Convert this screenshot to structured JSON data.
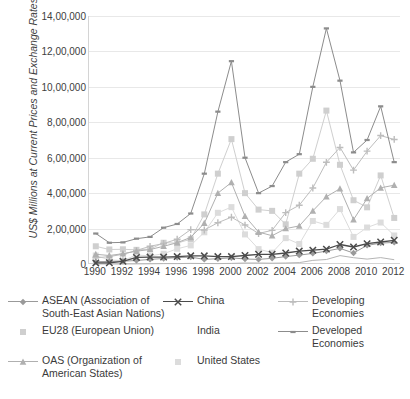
{
  "chart_data": {
    "type": "line",
    "title": "",
    "xlabel": "",
    "ylabel": "US$ Millions at Current Prices and Exchange Rates",
    "x": [
      1990,
      1991,
      1992,
      1993,
      1994,
      1995,
      1996,
      1997,
      1998,
      1999,
      2000,
      2001,
      2002,
      2003,
      2004,
      2005,
      2006,
      2007,
      2008,
      2009,
      2010,
      2011,
      2012
    ],
    "xlim": [
      1989.5,
      2012.5
    ],
    "ylim": [
      0,
      1400000
    ],
    "yticks": [
      0,
      200000,
      400000,
      600000,
      800000,
      1000000,
      1200000,
      1400000
    ],
    "ytick_labels": [
      "0",
      "2,00,000",
      "4,00,000",
      "6,00,000",
      "8,00,000",
      "10,00,000",
      "12,00,000",
      "14,00,000"
    ],
    "xticks": [
      1990,
      1992,
      1994,
      1996,
      1998,
      2000,
      2002,
      2004,
      2006,
      2008,
      2010,
      2012
    ],
    "xtick_labels": [
      "1990",
      "1992",
      "1994",
      "1996",
      "1998",
      "2000",
      "2002",
      "2004",
      "2006",
      "2008",
      "2010",
      "2012"
    ],
    "grid": "horizontal",
    "legend_position": "bottom",
    "series": [
      {
        "name": "ASEAN (Association of\nSouth-East Asian Nations)",
        "short": "ASEAN",
        "color": "#9a9a9a",
        "marker": "diamond",
        "values": [
          13000,
          14000,
          16000,
          20000,
          26000,
          31000,
          36000,
          39000,
          26000,
          30000,
          35000,
          28000,
          26000,
          32000,
          42000,
          50000,
          60000,
          73000,
          88000,
          62000,
          105000,
          118000,
          122000
        ]
      },
      {
        "name": "China",
        "short": "China",
        "color": "#4b4b4b",
        "marker": "x",
        "values": [
          6000,
          7000,
          15000,
          37000,
          39000,
          39000,
          42000,
          46000,
          46000,
          42000,
          42000,
          48000,
          55000,
          55000,
          62000,
          73000,
          78000,
          84000,
          110000,
          96000,
          115000,
          124000,
          134000
        ]
      },
      {
        "name": "Developing Economies",
        "short": "Developing Economies",
        "color": "#bdbdbd",
        "marker": "plus",
        "values": [
          35000,
          42000,
          55000,
          77000,
          100000,
          116000,
          140000,
          194000,
          192000,
          233000,
          264000,
          220000,
          172000,
          190000,
          290000,
          332000,
          429000,
          574000,
          658000,
          530000,
          637000,
          725000,
          703000
        ]
      },
      {
        "name": "EU28 (European Union)",
        "short": "EU28",
        "color": "#cfcfcf",
        "marker": "square",
        "values": [
          100000,
          82000,
          83000,
          80000,
          84000,
          120000,
          118000,
          140000,
          280000,
          510000,
          705000,
          400000,
          307000,
          300000,
          224000,
          510000,
          594000,
          866000,
          560000,
          360000,
          320000,
          500000,
          260000
        ]
      },
      {
        "name": "India",
        "short": "India",
        "color": "#b5b5b5",
        "marker": "none",
        "values": [
          237,
          75,
          252,
          532,
          974,
          2151,
          2525,
          3619,
          2633,
          2168,
          3585,
          5478,
          5630,
          4321,
          5778,
          7622,
          20328,
          25350,
          47139,
          35657,
          27431,
          36190,
          24196
        ]
      },
      {
        "name": "Developed Economies",
        "short": "Developed Economies",
        "color": "#8c8c8c",
        "marker": "dash",
        "values": [
          172000,
          120000,
          122000,
          143000,
          153000,
          205000,
          226000,
          285000,
          510000,
          860000,
          1145000,
          600000,
          400000,
          440000,
          575000,
          620000,
          1000000,
          1330000,
          1035000,
          630000,
          700000,
          890000,
          575000
        ]
      },
      {
        "name": "OAS (Organization of\nAmerican States)",
        "short": "OAS",
        "color": "#b0b0b0",
        "marker": "triangle",
        "values": [
          55000,
          48000,
          58000,
          72000,
          82000,
          100000,
          120000,
          150000,
          230000,
          400000,
          460000,
          270000,
          180000,
          160000,
          200000,
          215000,
          300000,
          380000,
          425000,
          250000,
          370000,
          430000,
          445000
        ]
      },
      {
        "name": "United States",
        "short": "United States",
        "color": "#dcdcdc",
        "marker": "square-light",
        "values": [
          48000,
          23000,
          19000,
          51000,
          46000,
          58000,
          86000,
          105000,
          179000,
          289000,
          321000,
          167000,
          84000,
          64000,
          146000,
          113000,
          243000,
          221000,
          310000,
          153000,
          206000,
          234000,
          161000
        ]
      }
    ]
  },
  "legend": {
    "items": [
      {
        "label": "ASEAN (Association of\nSouth-East Asian Nations)",
        "series": 0
      },
      {
        "label": "China",
        "series": 1
      },
      {
        "label": "Developing Economies",
        "series": 2
      },
      {
        "label": "EU28 (European Union)",
        "series": 3
      },
      {
        "label": "India",
        "series": 4
      },
      {
        "label": "Developed Economies",
        "series": 5
      },
      {
        "label": "OAS (Organization of\nAmerican States)",
        "series": 6
      },
      {
        "label": "United States",
        "series": 7
      }
    ]
  }
}
